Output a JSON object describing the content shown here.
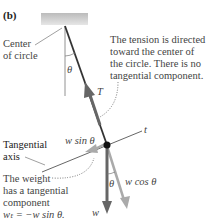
{
  "panel_label": "(b)",
  "labels": {
    "center": [
      "Center",
      "of circle"
    ],
    "theta_top": "θ",
    "tension": "T",
    "tension_note": [
      "The tension is directed",
      "toward the center of",
      "the circle. There is no",
      "tangential component."
    ],
    "tangential_axis": [
      "Tangential",
      "axis"
    ],
    "w_sin": "w sin θ",
    "t_axis": "t",
    "w_cos": "w cos θ",
    "theta_bottom": "θ",
    "weight": "w",
    "weight_note": [
      "The weight",
      "has a tangential",
      "component",
      "wₜ = −w sin θ."
    ]
  },
  "colors": {
    "line": "#555555",
    "weight_arrow": "#666666",
    "component_arrow": "#aaaaaa",
    "ceiling": "#cccccc"
  }
}
